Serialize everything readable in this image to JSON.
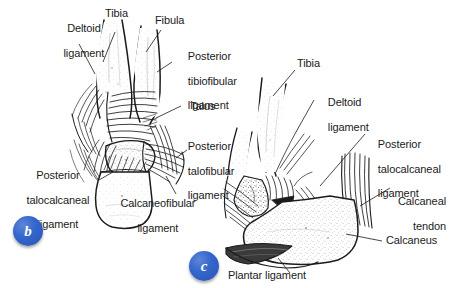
{
  "figure": {
    "background_color": "#ffffff",
    "ink_color": "#1b1b1b",
    "badge_color": "#3366cc",
    "panels": [
      {
        "key": "b",
        "badge_label": "b",
        "view": "posterior view of right ankle",
        "labels": [
          "Deltoid ligament",
          "Tibia",
          "Fibula",
          "Posterior tibiofibular ligament",
          "Talus",
          "Posterior talofibular ligament",
          "Posterior talocalcaneal ligament",
          "Calcaneofibular ligament"
        ]
      },
      {
        "key": "c",
        "badge_label": "c",
        "view": "lateral / medial view of right ankle",
        "labels": [
          "Tibia",
          "Deltoid ligament",
          "Posterior talocalcaneal ligament",
          "Calcaneal tendon",
          "Calcaneus",
          "Plantar ligament"
        ]
      }
    ]
  },
  "callouts": {
    "b_deltoid_l1": "Deltoid",
    "b_deltoid_l2": "ligament",
    "b_tibia": "Tibia",
    "b_fibula": "Fibula",
    "b_post_tibiofib_l1": "Posterior",
    "b_post_tibiofib_l2": "tibiofibular",
    "b_post_tibiofib_l3": "ligament",
    "b_talus": "Talus",
    "b_post_talofib_l1": "Posterior",
    "b_post_talofib_l2": "talofibular",
    "b_post_talofib_l3": "ligament",
    "b_post_talocalc_l1": "Posterior",
    "b_post_talocalc_l2": "talocalcaneal",
    "b_post_talocalc_l3": "ligament",
    "b_calcaneofib_l1": "Calcaneofibular",
    "b_calcaneofib_l2": "ligament",
    "c_tibia": "Tibia",
    "c_deltoid_l1": "Deltoid",
    "c_deltoid_l2": "ligament",
    "c_post_talocalc_l1": "Posterior",
    "c_post_talocalc_l2": "talocalcaneal",
    "c_post_talocalc_l3": "ligament",
    "c_calcaneal_tendon_l1": "Calcaneal",
    "c_calcaneal_tendon_l2": "tendon",
    "c_calcaneus": "Calcaneus",
    "c_plantar": "Plantar ligament"
  },
  "badges": {
    "b": "b",
    "c": "c"
  }
}
